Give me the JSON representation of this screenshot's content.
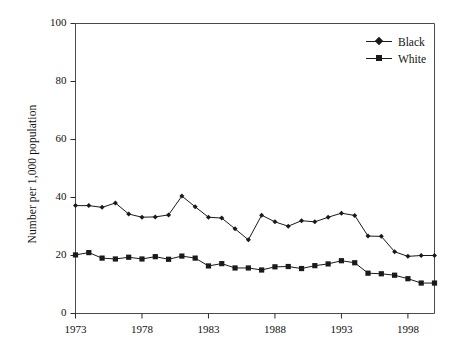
{
  "chart_data": {
    "type": "line",
    "title": "",
    "xlabel": "",
    "ylabel": "Number per 1,000 population",
    "ylim": [
      0,
      100
    ],
    "xlim": [
      1973,
      2000
    ],
    "ytick_labels": [
      "0",
      "20",
      "40",
      "60",
      "80",
      "100"
    ],
    "ytick_values": [
      0,
      20,
      40,
      60,
      80,
      100
    ],
    "xtick_labels": [
      "1973",
      "1978",
      "1983",
      "1988",
      "1993",
      "1998"
    ],
    "xtick_values": [
      1973,
      1978,
      1983,
      1988,
      1993,
      1998
    ],
    "grid": false,
    "legend_position": "top-right",
    "x": [
      1973,
      1974,
      1975,
      1976,
      1977,
      1978,
      1979,
      1980,
      1981,
      1982,
      1983,
      1984,
      1985,
      1986,
      1987,
      1988,
      1989,
      1990,
      1991,
      1992,
      1993,
      1994,
      1995,
      1996,
      1997,
      1998,
      1999,
      2000
    ],
    "series": [
      {
        "name": "Black",
        "marker": "diamond",
        "color": "#1a1a1a",
        "values": [
          37.2,
          37.2,
          36.6,
          38.1,
          34.3,
          33.2,
          33.3,
          34.0,
          40.5,
          36.8,
          33.2,
          32.9,
          29.2,
          25.4,
          33.9,
          31.6,
          30.1,
          32.0,
          31.6,
          33.2,
          34.6,
          33.8,
          26.7,
          26.6,
          21.3,
          19.7,
          20.0,
          20.0
        ]
      },
      {
        "name": "White",
        "marker": "square",
        "color": "#1a1a1a",
        "values": [
          20.2,
          21.0,
          19.1,
          18.8,
          19.4,
          18.8,
          19.6,
          18.7,
          19.8,
          19.1,
          16.4,
          17.2,
          15.7,
          15.7,
          15.0,
          16.1,
          16.2,
          15.5,
          16.5,
          17.1,
          18.2,
          17.5,
          13.9,
          13.7,
          13.2,
          12.0,
          10.5,
          10.5
        ]
      }
    ]
  },
  "legend": {
    "items": [
      {
        "label": "Black"
      },
      {
        "label": "White"
      }
    ]
  },
  "axes": {
    "y_title": "Number per 1,000 population"
  }
}
